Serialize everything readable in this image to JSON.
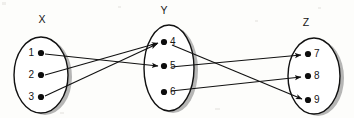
{
  "diagram": {
    "type": "mapping-diagram",
    "title": "",
    "background_color": "#fdfdfb",
    "ink_color": "#111111",
    "shadow_color": "#9a9a9a",
    "sets": [
      {
        "id": "X",
        "label": "X",
        "label_x": 42,
        "label_y": 20,
        "cx": 41,
        "cy": 75,
        "rx": 27,
        "ry": 38,
        "label_side": "left",
        "nodes": [
          {
            "id": "1",
            "label": "1",
            "x": 41,
            "y": 53
          },
          {
            "id": "2",
            "label": "2",
            "x": 41,
            "y": 75
          },
          {
            "id": "3",
            "label": "3",
            "x": 41,
            "y": 97
          }
        ]
      },
      {
        "id": "Y",
        "label": "Y",
        "label_x": 164,
        "label_y": 11,
        "cx": 169,
        "cy": 68,
        "rx": 25,
        "ry": 43,
        "label_side": "right",
        "nodes": [
          {
            "id": "4",
            "label": "4",
            "x": 164,
            "y": 42
          },
          {
            "id": "5",
            "label": "5",
            "x": 164,
            "y": 66
          },
          {
            "id": "6",
            "label": "6",
            "x": 164,
            "y": 92
          }
        ]
      },
      {
        "id": "Z",
        "label": "Z",
        "label_x": 306,
        "label_y": 23,
        "cx": 314,
        "cy": 76,
        "rx": 26,
        "ry": 38,
        "label_side": "right",
        "nodes": [
          {
            "id": "7",
            "label": "7",
            "x": 308,
            "y": 54
          },
          {
            "id": "8",
            "label": "8",
            "x": 308,
            "y": 76
          },
          {
            "id": "9",
            "label": "9",
            "x": 308,
            "y": 100
          }
        ]
      }
    ],
    "edges": [
      {
        "id": "e-1-5",
        "from": "1",
        "to": "5",
        "x1": 45,
        "y1": 54,
        "x2": 158,
        "y2": 66
      },
      {
        "id": "e-2-4",
        "from": "2",
        "to": "4",
        "x1": 45,
        "y1": 75,
        "x2": 158,
        "y2": 43
      },
      {
        "id": "e-3-4",
        "from": "3",
        "to": "4",
        "x1": 45,
        "y1": 96,
        "x2": 157,
        "y2": 44
      },
      {
        "id": "e-4-9",
        "from": "4",
        "to": "9",
        "x1": 172,
        "y1": 45,
        "x2": 302,
        "y2": 99
      },
      {
        "id": "e-5-7",
        "from": "5",
        "to": "7",
        "x1": 171,
        "y1": 67,
        "x2": 301,
        "y2": 55
      },
      {
        "id": "e-6-8",
        "from": "6",
        "to": "8",
        "x1": 171,
        "y1": 91,
        "x2": 301,
        "y2": 77
      }
    ],
    "specks": [
      {
        "x": 2,
        "y": 2,
        "w": 4,
        "h": 3
      },
      {
        "x": 118,
        "y": 6,
        "w": 3,
        "h": 2
      },
      {
        "x": 318,
        "y": 7,
        "w": 3,
        "h": 2
      },
      {
        "x": 215,
        "y": 108,
        "w": 5,
        "h": 2
      },
      {
        "x": 60,
        "y": 112,
        "w": 4,
        "h": 2
      },
      {
        "x": 255,
        "y": 20,
        "w": 3,
        "h": 2
      }
    ]
  }
}
